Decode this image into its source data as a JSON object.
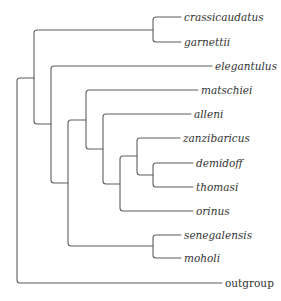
{
  "tree": {
    "type": "cladogram",
    "colors": {
      "branch": "#5f5f5f",
      "label": "#333333",
      "background": "#ffffff"
    },
    "taxa": [
      {
        "id": "crassicaudatus",
        "label": "crassicaudatus",
        "italic": true
      },
      {
        "id": "garnettii",
        "label": "garnettii",
        "italic": true
      },
      {
        "id": "elegantulus",
        "label": "elegantulus",
        "italic": true
      },
      {
        "id": "matschiei",
        "label": "matschiei",
        "italic": true
      },
      {
        "id": "alleni",
        "label": "alleni",
        "italic": true
      },
      {
        "id": "zanzibaricus",
        "label": "zanzibaricus",
        "italic": true
      },
      {
        "id": "demidoff",
        "label": "demidoff",
        "italic": true
      },
      {
        "id": "thomasi",
        "label": "thomasi",
        "italic": true
      },
      {
        "id": "orinus",
        "label": "orinus",
        "italic": true
      },
      {
        "id": "senegalensis",
        "label": "senegalensis",
        "italic": true
      },
      {
        "id": "moholi",
        "label": "moholi",
        "italic": true
      },
      {
        "id": "outgroup",
        "label": "outgroup",
        "italic": false
      }
    ],
    "newick": "((((crassicaudatus,garnettii),(elegantulus,((matschiei,(alleni,((zanzibaricus,(demidoff,thomasi)),orinus))),(senegalensis,moholi)))),outgroup);"
  }
}
